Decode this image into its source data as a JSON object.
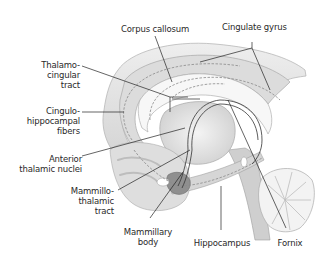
{
  "diagram": {
    "labels": {
      "corpus_callosum": "Corpus callosum",
      "cingulate_gyrus": "Cingulate gyrus",
      "thalamo_cingular_tract": "Thalamo-\ncingular\ntract",
      "cingulo_hippocampal_fibers": "Cingulo-\nhippocampal\nfibers",
      "anterior_thalamic_nuclei": "Anterior\nthalamic nuclei",
      "mammillothalamic_tract": "Mammillo-\nthalamic\ntract",
      "mammillary_body": "Mammillary\nbody",
      "hippocampus": "Hippocampus",
      "fornix": "Fornix"
    },
    "colors": {
      "background": "#ffffff",
      "tissue_light": "#e6e6e6",
      "tissue_mid": "#cfcfcf",
      "tissue_dark": "#9a9a9a",
      "leader_line": "#222222",
      "dashed_pathway": "#8a8a8a"
    }
  }
}
